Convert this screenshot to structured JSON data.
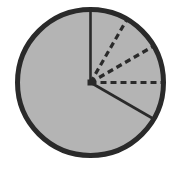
{
  "diagram": {
    "type": "fraction-circle",
    "center": [
      90.5,
      82.5
    ],
    "radius": 73,
    "fill_color": "#b4b4b4",
    "stroke_color": "#2a2a2a",
    "solid_radii_angles_deg": [
      0,
      120
    ],
    "dashed_radii_angles_deg": [
      30,
      60,
      90
    ]
  }
}
